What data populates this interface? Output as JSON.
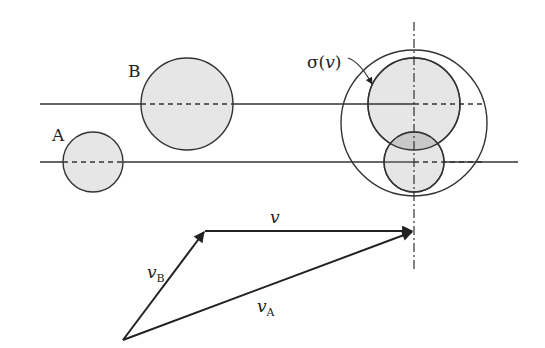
{
  "labels": {
    "circle_a": "A",
    "circle_b": "B",
    "sigma": "σ(",
    "sigma_v": "v",
    "sigma_close": ")",
    "vec_v": "v",
    "vec_vb": "v",
    "vec_vb_sub": "B",
    "vec_va": "v",
    "vec_va_sub": "A"
  },
  "colors": {
    "stroke": "#333333",
    "fill": "#e6e6e6",
    "overlap_fill": "#c8c8c8"
  }
}
